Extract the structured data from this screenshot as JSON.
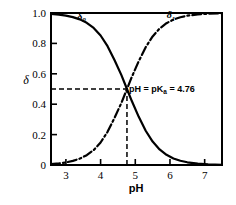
{
  "chart_data": {
    "type": "line",
    "title": "",
    "subtitle": "",
    "xlabel": "pH",
    "ylabel": "δ",
    "xlim": [
      2.57,
      7.5
    ],
    "ylim": [
      0,
      1.0
    ],
    "grid": false,
    "legend_position": "inline-curve-labels",
    "xticks": [
      3,
      4,
      5,
      6,
      7
    ],
    "xtick_labels": [
      "3",
      "4",
      "5",
      "6",
      "7"
    ],
    "yticks": [
      0,
      0.2,
      0.4,
      0.6,
      0.8,
      1.0
    ],
    "ytick_labels": [
      "0",
      "0.2",
      "0.4",
      "0.6",
      "0.8",
      "1.0"
    ],
    "pKa": 4.76,
    "x": [
      2.57,
      2.8,
      3.0,
      3.2,
      3.4,
      3.6,
      3.8,
      4.0,
      4.2,
      4.4,
      4.6,
      4.76,
      4.9,
      5.1,
      5.3,
      5.5,
      5.7,
      5.9,
      6.1,
      6.3,
      6.5,
      6.8,
      7.1,
      7.5
    ],
    "series": [
      {
        "name": "δ0",
        "label": "δ",
        "subscript": "0",
        "style": "solid",
        "color": "#000000",
        "label_x": 3.45,
        "label_y": 0.955,
        "values": [
          0.9938,
          0.9894,
          0.9829,
          0.973,
          0.958,
          0.9354,
          0.9019,
          0.8521,
          0.782,
          0.691,
          0.5912,
          0.5,
          0.4207,
          0.3167,
          0.2253,
          0.1542,
          0.1025,
          0.067,
          0.0433,
          0.0278,
          0.0178,
          0.009,
          0.0045,
          0.0018
        ]
      },
      {
        "name": "δ1",
        "label": "δ",
        "subscript": "1",
        "style": "dashdot",
        "color": "#000000",
        "label_x": 6.03,
        "label_y": 0.965,
        "values": [
          0.0062,
          0.0106,
          0.0171,
          0.027,
          0.042,
          0.0646,
          0.0981,
          0.1479,
          0.218,
          0.309,
          0.4088,
          0.5,
          0.5793,
          0.6833,
          0.7747,
          0.8458,
          0.8975,
          0.933,
          0.9567,
          0.9722,
          0.9822,
          0.991,
          0.9955,
          0.9982
        ]
      }
    ],
    "annotations": [
      {
        "name": "pka-annotation",
        "text_parts": {
          "lead": "pH = pK",
          "sub": "a",
          "trail": " = 4.76"
        },
        "full_text": "pH = pKa = 4.76",
        "x": 4.82,
        "y": 0.5
      }
    ],
    "guides": [
      {
        "name": "horizontal-guide",
        "orientation": "horizontal",
        "value": 0.5,
        "style": "dashed",
        "from": 2.57,
        "to": 4.76
      },
      {
        "name": "vertical-guide",
        "orientation": "vertical",
        "value": 4.76,
        "style": "dashed",
        "from": 0,
        "to": 0.5
      }
    ]
  },
  "axes": {
    "x_title": "pH",
    "y_title": "δ",
    "frame_color": "#000000"
  }
}
